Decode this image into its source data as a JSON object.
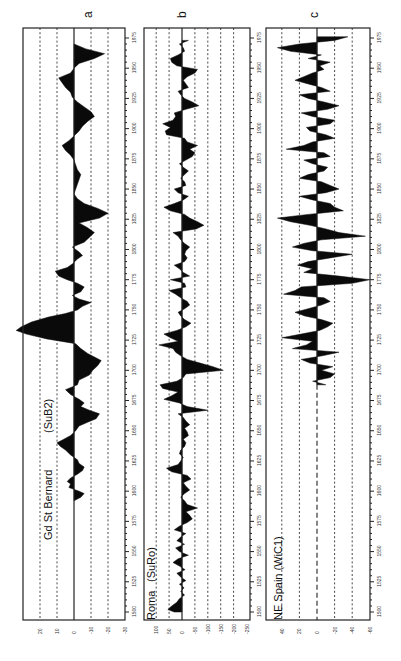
{
  "figure": {
    "orientation": "rotated-90-ccw",
    "background": "#ffffff",
    "ink": "#0a0a0a"
  },
  "chart_data": [
    {
      "type": "area",
      "panel_letter": "a",
      "title": "Gd St Bernard",
      "subtitle": "(SuB2)",
      "xlabel": "Year",
      "ylabel": "",
      "x_ticks": [
        1500,
        1525,
        1550,
        1575,
        1600,
        1625,
        1650,
        1675,
        1700,
        1725,
        1750,
        1775,
        1800,
        1825,
        1850,
        1875,
        1900,
        1925,
        1950,
        1975
      ],
      "y_ticks": [
        20,
        10,
        0,
        -10,
        -20,
        -30
      ],
      "ylim": [
        30,
        -30
      ],
      "grid": true,
      "gridlines": [
        20,
        10,
        -10,
        -20
      ],
      "zero_line": "solid",
      "geom": {
        "left": 23,
        "right": 125,
        "zero": 74,
        "per_unit": 1.7
      },
      "x": [
        1592,
        1595,
        1598,
        1600,
        1603,
        1606,
        1608,
        1611,
        1614,
        1617,
        1620,
        1623,
        1626,
        1630,
        1634,
        1637,
        1640,
        1643,
        1646,
        1650,
        1654,
        1657,
        1660,
        1664,
        1667,
        1670,
        1673,
        1676,
        1680,
        1684,
        1688,
        1692,
        1696,
        1700,
        1704,
        1708,
        1711,
        1714,
        1718,
        1722,
        1726,
        1730,
        1733,
        1736,
        1740,
        1744,
        1747,
        1750,
        1753,
        1756,
        1759,
        1762,
        1765,
        1769,
        1772,
        1775,
        1778,
        1782,
        1785,
        1788,
        1792,
        1795,
        1798,
        1802,
        1806,
        1810,
        1814,
        1818,
        1822,
        1826,
        1830,
        1834,
        1838,
        1842,
        1846,
        1850,
        1854,
        1858,
        1862,
        1866,
        1870,
        1874,
        1878,
        1882,
        1886,
        1890,
        1894,
        1898,
        1902,
        1906,
        1910,
        1914,
        1918,
        1922,
        1926,
        1930,
        1934,
        1938,
        1942,
        1946,
        1950,
        1954,
        1958,
        1962,
        1966,
        1970
      ],
      "values": [
        0,
        -4,
        -6,
        -3,
        3,
        2,
        4,
        2,
        -2,
        -5,
        -6,
        -3,
        -2,
        2,
        5,
        8,
        10,
        6,
        2,
        -1,
        -3,
        -8,
        -13,
        -15,
        -9,
        -4,
        -6,
        -3,
        2,
        5,
        -2,
        -3,
        -9,
        -11,
        -14,
        -16,
        -12,
        -8,
        -4,
        -1,
        16,
        28,
        34,
        31,
        25,
        15,
        5,
        -2,
        -5,
        -10,
        -3,
        1,
        -4,
        -6,
        -2,
        4,
        9,
        11,
        4,
        1,
        -2,
        -5,
        -3,
        1,
        -6,
        -9,
        -12,
        -8,
        -3,
        -15,
        -20,
        -14,
        -6,
        -2,
        0,
        -1,
        -2,
        -3,
        -4,
        -2,
        -1,
        0,
        2,
        5,
        7,
        3,
        0,
        -3,
        -5,
        -8,
        -12,
        -10,
        -6,
        -2,
        1,
        2,
        5,
        7,
        9,
        2,
        0,
        -3,
        -12,
        -18,
        -7,
        0
      ]
    },
    {
      "type": "area",
      "panel_letter": "b",
      "title": "Roma",
      "subtitle": "(SuRo)",
      "xlabel": "Year",
      "ylabel": "",
      "x_ticks": [
        1500,
        1525,
        1550,
        1575,
        1600,
        1625,
        1650,
        1675,
        1700,
        1725,
        1750,
        1775,
        1800,
        1825,
        1850,
        1875,
        1900,
        1925,
        1950,
        1975
      ],
      "y_ticks": [
        100,
        50,
        0,
        -50,
        -100,
        -150,
        -200,
        -250
      ],
      "ylim": [
        100,
        -250
      ],
      "grid": true,
      "gridlines": [
        100,
        50,
        -50,
        -100,
        -150,
        -200
      ],
      "zero_line": "solid",
      "geom": {
        "left": 144,
        "right": 250,
        "zero": 182,
        "per_unit": 0.258
      },
      "x": [
        1500,
        1502,
        1505,
        1508,
        1511,
        1514,
        1517,
        1520,
        1523,
        1526,
        1529,
        1532,
        1535,
        1538,
        1541,
        1544,
        1547,
        1550,
        1553,
        1556,
        1559,
        1562,
        1565,
        1568,
        1571,
        1574,
        1577,
        1580,
        1583,
        1586,
        1589,
        1592,
        1595,
        1598,
        1601,
        1604,
        1607,
        1610,
        1613,
        1616,
        1619,
        1622,
        1625,
        1628,
        1631,
        1634,
        1637,
        1640,
        1643,
        1646,
        1649,
        1652,
        1655,
        1658,
        1661,
        1664,
        1667,
        1670,
        1673,
        1676,
        1679,
        1682,
        1685,
        1688,
        1691,
        1694,
        1697,
        1700,
        1703,
        1706,
        1709,
        1712,
        1715,
        1718,
        1721,
        1724,
        1727,
        1730,
        1733,
        1736,
        1739,
        1742,
        1745,
        1748,
        1751,
        1754,
        1757,
        1760,
        1763,
        1766,
        1769,
        1772,
        1775,
        1778,
        1781,
        1784,
        1787,
        1790,
        1793,
        1796,
        1799,
        1802,
        1805,
        1808,
        1811,
        1814,
        1817,
        1820,
        1823,
        1826,
        1829,
        1832,
        1835,
        1838,
        1841,
        1844,
        1847,
        1850,
        1853,
        1856,
        1859,
        1862,
        1865,
        1868,
        1871,
        1874,
        1877,
        1880,
        1883,
        1886,
        1889,
        1892,
        1895,
        1898,
        1901,
        1904,
        1907,
        1910,
        1913,
        1916,
        1919,
        1922,
        1925,
        1928,
        1931,
        1934,
        1937,
        1940,
        1943,
        1946,
        1949,
        1952,
        1955,
        1958,
        1961,
        1964,
        1967,
        1970,
        1973
      ],
      "values": [
        30,
        55,
        40,
        20,
        10,
        -10,
        5,
        -8,
        10,
        -15,
        5,
        20,
        -12,
        10,
        35,
        15,
        -25,
        10,
        25,
        -10,
        20,
        5,
        -15,
        30,
        10,
        -20,
        -40,
        -30,
        -15,
        -60,
        -20,
        -10,
        5,
        -10,
        -30,
        -15,
        -5,
        -35,
        -20,
        40,
        60,
        15,
        5,
        -5,
        10,
        5,
        -10,
        -15,
        -5,
        -25,
        -20,
        -10,
        -30,
        -15,
        -5,
        15,
        -100,
        -20,
        10,
        70,
        40,
        15,
        75,
        85,
        20,
        -5,
        -15,
        -160,
        -120,
        -70,
        -20,
        5,
        25,
        35,
        90,
        15,
        45,
        70,
        20,
        -15,
        -35,
        -10,
        5,
        15,
        -10,
        -30,
        -20,
        5,
        25,
        50,
        -15,
        -10,
        45,
        -30,
        -5,
        10,
        30,
        -10,
        -20,
        -10,
        -15,
        -30,
        -10,
        5,
        15,
        35,
        -55,
        -85,
        -60,
        -30,
        -10,
        45,
        70,
        30,
        -5,
        -25,
        15,
        30,
        -15,
        -10,
        5,
        -10,
        -25,
        -5,
        10,
        -15,
        -40,
        -50,
        -30,
        -60,
        -20,
        -10,
        60,
        65,
        45,
        75,
        35,
        25,
        30,
        -15,
        -65,
        -40,
        -10,
        5,
        15,
        -25,
        -15,
        -5,
        -20,
        -50,
        -60,
        20,
        40,
        45,
        15,
        -10,
        -5,
        10,
        -25,
        -30,
        20,
        35,
        25
      ]
    },
    {
      "type": "area",
      "panel_letter": "c",
      "title": "NE Spain",
      "subtitle": "(WiC1)",
      "xlabel": "Year",
      "ylabel": "",
      "x_ticks": [
        1500,
        1525,
        1550,
        1575,
        1600,
        1625,
        1650,
        1675,
        1700,
        1725,
        1750,
        1775,
        1800,
        1825,
        1850,
        1875,
        1900,
        1925,
        1950,
        1975
      ],
      "y_ticks": [
        40,
        20,
        0,
        -20,
        -40,
        -60
      ],
      "ylim": [
        60,
        -60
      ],
      "grid": true,
      "gridlines": [
        40,
        20,
        -20,
        -40
      ],
      "zero_line": "dashed-before-data",
      "geom": {
        "left": 266,
        "right": 370,
        "zero": 317,
        "per_unit": 0.88
      },
      "x": [
        1688,
        1691,
        1694,
        1697,
        1700,
        1703,
        1706,
        1709,
        1712,
        1715,
        1718,
        1721,
        1724,
        1727,
        1730,
        1733,
        1736,
        1739,
        1742,
        1745,
        1748,
        1751,
        1754,
        1757,
        1760,
        1763,
        1766,
        1769,
        1772,
        1775,
        1778,
        1781,
        1784,
        1787,
        1790,
        1793,
        1796,
        1799,
        1802,
        1805,
        1808,
        1811,
        1814,
        1817,
        1820,
        1823,
        1826,
        1829,
        1832,
        1835,
        1838,
        1841,
        1844,
        1847,
        1850,
        1853,
        1856,
        1859,
        1862,
        1865,
        1868,
        1871,
        1874,
        1877,
        1880,
        1883,
        1886,
        1889,
        1892,
        1895,
        1898,
        1901,
        1904,
        1907,
        1910,
        1913,
        1916,
        1919,
        1922,
        1925,
        1928,
        1931,
        1934,
        1937,
        1940,
        1943,
        1946,
        1949,
        1952,
        1955,
        1958,
        1961,
        1964,
        1967,
        1970,
        1973,
        1976
      ],
      "values": [
        -10,
        5,
        -15,
        -20,
        -5,
        -18,
        8,
        18,
        -6,
        -25,
        28,
        12,
        5,
        40,
        18,
        -3,
        -12,
        -18,
        -5,
        14,
        25,
        10,
        -5,
        -15,
        -8,
        38,
        25,
        18,
        -40,
        -60,
        -25,
        15,
        5,
        22,
        10,
        -15,
        -40,
        5,
        28,
        15,
        -5,
        -55,
        -25,
        -10,
        8,
        30,
        45,
        10,
        -30,
        -20,
        -15,
        5,
        20,
        -10,
        -25,
        -15,
        -5,
        20,
        10,
        -8,
        -12,
        5,
        15,
        -15,
        -8,
        35,
        15,
        5,
        -20,
        -10,
        8,
        12,
        -15,
        -20,
        5,
        18,
        -12,
        -25,
        -8,
        10,
        20,
        -15,
        -5,
        10,
        25,
        15,
        5,
        -8,
        -3,
        -15,
        10,
        -5,
        30,
        45,
        20,
        -20,
        -35
      ]
    }
  ],
  "panels": {
    "a": {
      "letter": "a",
      "title": "Gd St Bernard",
      "subtitle": "(SuB2)"
    },
    "b": {
      "letter": "b",
      "title": "Roma",
      "subtitle": "(SuRo)"
    },
    "c": {
      "letter": "c",
      "title": "NE Spain (WiC1)"
    }
  }
}
